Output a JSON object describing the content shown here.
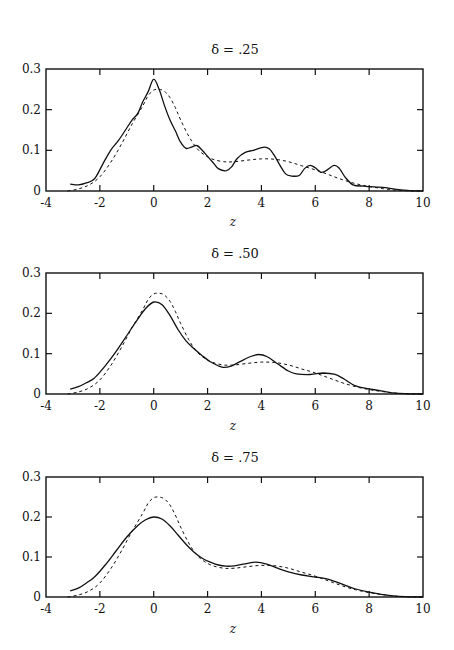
{
  "figure": {
    "panels": [
      {
        "title": "δ = .25",
        "xlabel": "z"
      },
      {
        "title": "δ = .50",
        "xlabel": "z"
      },
      {
        "title": "δ = .75",
        "xlabel": "z"
      }
    ]
  },
  "chart_data": [
    {
      "type": "line",
      "title": "δ = .25",
      "xlabel": "z",
      "ylabel": "",
      "xlim": [
        -4,
        10
      ],
      "ylim": [
        0,
        0.3
      ],
      "xticks": [
        -4,
        -2,
        0,
        2,
        4,
        6,
        8,
        10
      ],
      "yticks": [
        0,
        0.1,
        0.2,
        0.3
      ],
      "ytick_labels": [
        "0",
        "0.1",
        "0.2",
        "0.3"
      ],
      "grid": false,
      "legend": null,
      "series": [
        {
          "name": "estimate",
          "style": "solid",
          "x": [
            -3.1,
            -2.8,
            -2.5,
            -2.2,
            -1.9,
            -1.6,
            -1.3,
            -1.0,
            -0.8,
            -0.6,
            -0.4,
            -0.2,
            0.0,
            0.2,
            0.4,
            0.6,
            0.8,
            1.0,
            1.2,
            1.4,
            1.6,
            1.8,
            2.0,
            2.2,
            2.4,
            2.7,
            2.9,
            3.1,
            3.4,
            3.7,
            4.1,
            4.3,
            4.5,
            4.7,
            4.9,
            5.1,
            5.4,
            5.6,
            5.8,
            6.0,
            6.2,
            6.4,
            6.7,
            6.9,
            7.1,
            7.4,
            7.8,
            8.2,
            8.6,
            9.0,
            9.5,
            10.0
          ],
          "values": [
            0.017,
            0.015,
            0.02,
            0.03,
            0.065,
            0.1,
            0.125,
            0.155,
            0.175,
            0.19,
            0.22,
            0.245,
            0.275,
            0.25,
            0.21,
            0.175,
            0.148,
            0.12,
            0.105,
            0.108,
            0.112,
            0.1,
            0.085,
            0.07,
            0.055,
            0.05,
            0.06,
            0.08,
            0.095,
            0.1,
            0.108,
            0.103,
            0.085,
            0.062,
            0.042,
            0.037,
            0.038,
            0.055,
            0.063,
            0.057,
            0.046,
            0.05,
            0.063,
            0.055,
            0.035,
            0.015,
            0.012,
            0.01,
            0.008,
            0.004,
            0.001,
            0.0
          ]
        },
        {
          "name": "reference",
          "style": "dashed",
          "x": [
            -3.2,
            -2.8,
            -2.4,
            -2.0,
            -1.6,
            -1.2,
            -0.8,
            -0.4,
            -0.2,
            0.0,
            0.2,
            0.4,
            0.6,
            0.8,
            1.0,
            1.3,
            1.6,
            1.9,
            2.2,
            2.6,
            3.0,
            3.5,
            4.0,
            4.5,
            5.0,
            5.5,
            6.0,
            6.5,
            7.0,
            7.5,
            8.0,
            8.5,
            9.0,
            9.5,
            10.0
          ],
          "values": [
            0.0,
            0.005,
            0.015,
            0.035,
            0.07,
            0.115,
            0.165,
            0.21,
            0.235,
            0.248,
            0.25,
            0.245,
            0.23,
            0.205,
            0.175,
            0.135,
            0.105,
            0.088,
            0.078,
            0.072,
            0.072,
            0.076,
            0.079,
            0.078,
            0.072,
            0.062,
            0.052,
            0.04,
            0.028,
            0.018,
            0.011,
            0.006,
            0.002,
            0.0005,
            0.0
          ]
        }
      ]
    },
    {
      "type": "line",
      "title": "δ = .50",
      "xlabel": "z",
      "ylabel": "",
      "xlim": [
        -4,
        10
      ],
      "ylim": [
        0,
        0.3
      ],
      "xticks": [
        -4,
        -2,
        0,
        2,
        4,
        6,
        8,
        10
      ],
      "yticks": [
        0,
        0.1,
        0.2,
        0.3
      ],
      "ytick_labels": [
        "0",
        "0.1",
        "0.2",
        "0.3"
      ],
      "grid": false,
      "legend": null,
      "series": [
        {
          "name": "estimate",
          "style": "solid",
          "x": [
            -3.1,
            -2.8,
            -2.5,
            -2.2,
            -1.8,
            -1.4,
            -1.0,
            -0.6,
            -0.3,
            0.0,
            0.3,
            0.6,
            0.9,
            1.2,
            1.5,
            1.8,
            2.1,
            2.4,
            2.6,
            2.9,
            3.2,
            3.6,
            3.9,
            4.2,
            4.6,
            5.0,
            5.3,
            5.7,
            6.0,
            6.3,
            6.7,
            7.0,
            7.5,
            8.0,
            8.5,
            9.0,
            9.5,
            10.0
          ],
          "values": [
            0.012,
            0.018,
            0.028,
            0.04,
            0.07,
            0.105,
            0.145,
            0.185,
            0.212,
            0.228,
            0.222,
            0.195,
            0.16,
            0.132,
            0.112,
            0.095,
            0.08,
            0.07,
            0.066,
            0.07,
            0.08,
            0.093,
            0.098,
            0.093,
            0.075,
            0.057,
            0.05,
            0.048,
            0.05,
            0.052,
            0.049,
            0.04,
            0.02,
            0.013,
            0.007,
            0.002,
            0.0005,
            0.0
          ]
        },
        {
          "name": "reference",
          "style": "dashed",
          "x": [
            -3.2,
            -2.8,
            -2.4,
            -2.0,
            -1.6,
            -1.2,
            -0.8,
            -0.4,
            -0.2,
            0.0,
            0.2,
            0.4,
            0.6,
            0.8,
            1.0,
            1.3,
            1.6,
            1.9,
            2.2,
            2.6,
            3.0,
            3.5,
            4.0,
            4.5,
            5.0,
            5.5,
            6.0,
            6.5,
            7.0,
            7.5,
            8.0,
            8.5,
            9.0,
            9.5,
            10.0
          ],
          "values": [
            0.0,
            0.005,
            0.015,
            0.035,
            0.07,
            0.115,
            0.165,
            0.21,
            0.235,
            0.248,
            0.25,
            0.245,
            0.23,
            0.205,
            0.175,
            0.135,
            0.105,
            0.088,
            0.078,
            0.072,
            0.072,
            0.076,
            0.079,
            0.078,
            0.072,
            0.062,
            0.052,
            0.04,
            0.028,
            0.018,
            0.011,
            0.006,
            0.002,
            0.0005,
            0.0
          ]
        }
      ]
    },
    {
      "type": "line",
      "title": "δ = .75",
      "xlabel": "z",
      "ylabel": "",
      "xlim": [
        -4,
        10
      ],
      "ylim": [
        0,
        0.3
      ],
      "xticks": [
        -4,
        -2,
        0,
        2,
        4,
        6,
        8,
        10
      ],
      "yticks": [
        0,
        0.1,
        0.2,
        0.3
      ],
      "ytick_labels": [
        "0",
        "0.1",
        "0.2",
        "0.3"
      ],
      "grid": false,
      "legend": null,
      "series": [
        {
          "name": "estimate",
          "style": "solid",
          "x": [
            -3.1,
            -2.8,
            -2.5,
            -2.2,
            -1.8,
            -1.4,
            -1.0,
            -0.6,
            -0.3,
            0.0,
            0.3,
            0.6,
            0.9,
            1.2,
            1.5,
            1.8,
            2.1,
            2.4,
            2.7,
            3.0,
            3.4,
            3.8,
            4.2,
            4.6,
            5.0,
            5.5,
            6.0,
            6.5,
            7.0,
            7.5,
            8.0,
            8.5,
            9.0,
            9.5,
            10.0
          ],
          "values": [
            0.015,
            0.022,
            0.035,
            0.05,
            0.08,
            0.115,
            0.15,
            0.178,
            0.193,
            0.2,
            0.195,
            0.178,
            0.155,
            0.132,
            0.112,
            0.097,
            0.087,
            0.08,
            0.077,
            0.078,
            0.083,
            0.087,
            0.082,
            0.072,
            0.063,
            0.055,
            0.05,
            0.044,
            0.032,
            0.02,
            0.012,
            0.006,
            0.002,
            0.0005,
            0.0
          ]
        },
        {
          "name": "reference",
          "style": "dashed",
          "x": [
            -3.2,
            -2.8,
            -2.4,
            -2.0,
            -1.6,
            -1.2,
            -0.8,
            -0.4,
            -0.2,
            0.0,
            0.2,
            0.4,
            0.6,
            0.8,
            1.0,
            1.3,
            1.6,
            1.9,
            2.2,
            2.6,
            3.0,
            3.5,
            4.0,
            4.5,
            5.0,
            5.5,
            6.0,
            6.5,
            7.0,
            7.5,
            8.0,
            8.5,
            9.0,
            9.5,
            10.0
          ],
          "values": [
            0.0,
            0.005,
            0.015,
            0.035,
            0.07,
            0.115,
            0.165,
            0.21,
            0.235,
            0.248,
            0.25,
            0.245,
            0.23,
            0.205,
            0.175,
            0.135,
            0.105,
            0.088,
            0.078,
            0.072,
            0.072,
            0.076,
            0.079,
            0.078,
            0.072,
            0.062,
            0.052,
            0.04,
            0.028,
            0.018,
            0.011,
            0.006,
            0.002,
            0.0005,
            0.0
          ]
        }
      ]
    }
  ]
}
